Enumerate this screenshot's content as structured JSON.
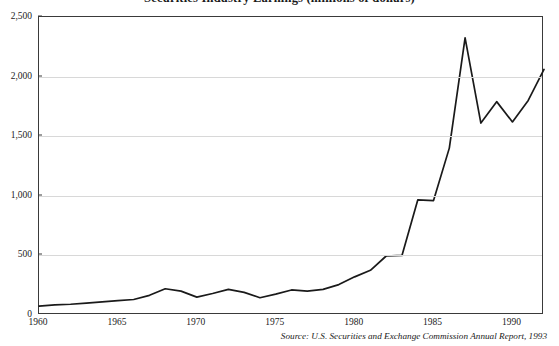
{
  "chart_title": "Securities Industry Earnings (millions of dollars)",
  "source_note": "Source: U.S. Securities and Exchange Commission Annual Report, 1993",
  "axes": {
    "y_ticks": [
      "0",
      "500",
      "1,000",
      "1,500",
      "2,000",
      "2,500"
    ],
    "x_ticks": [
      "1960",
      "1965",
      "1970",
      "1975",
      "1980",
      "1985",
      "1990"
    ]
  },
  "chart_data": {
    "type": "line",
    "title": "Securities Industry Earnings (millions of dollars)",
    "xlabel": "",
    "ylabel": "",
    "xlim": [
      1960,
      1992
    ],
    "ylim": [
      0,
      2500
    ],
    "grid": true,
    "legend": "none",
    "annotations": [
      "Source: U.S. Securities and Exchange Commission Annual Report, 1993"
    ],
    "x_tick_values": [
      1960,
      1965,
      1970,
      1975,
      1980,
      1985,
      1990
    ],
    "y_tick_values": [
      0,
      500,
      1000,
      1500,
      2000,
      2500
    ],
    "x": [
      1960,
      1961,
      1962,
      1963,
      1964,
      1965,
      1966,
      1967,
      1968,
      1969,
      1970,
      1971,
      1972,
      1973,
      1974,
      1975,
      1976,
      1977,
      1978,
      1979,
      1980,
      1981,
      1982,
      1983,
      1984,
      1985,
      1986,
      1987,
      1988,
      1989,
      1990,
      1991,
      1992
    ],
    "series": [
      {
        "name": "Securities industry earnings",
        "color": "#1a1a1a",
        "values": [
          75,
          85,
          90,
          100,
          110,
          120,
          130,
          165,
          220,
          200,
          150,
          180,
          215,
          190,
          145,
          175,
          210,
          200,
          215,
          255,
          320,
          375,
          495,
          500,
          965,
          960,
          1400,
          2325,
          1610,
          1790,
          1620,
          1800,
          2060
        ]
      }
    ]
  }
}
